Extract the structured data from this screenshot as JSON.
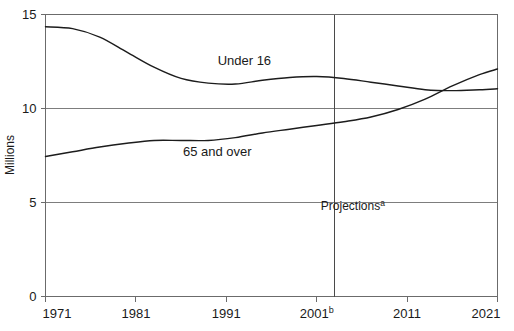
{
  "chart_data": {
    "type": "line",
    "title": "",
    "subtitle": "",
    "xlabel": "",
    "ylabel": "Millions",
    "xlim": [
      1971,
      2021
    ],
    "ylim": [
      0,
      15
    ],
    "grid": true,
    "grid_axis": "y",
    "legend_position": "inline-labels",
    "x_tick_labels": [
      "1971",
      "1981",
      "1991",
      "2001",
      "2011",
      "2021"
    ],
    "x_tick_values": [
      1971,
      1981,
      1991,
      2001,
      2011,
      2021
    ],
    "x_tick_superscripts": [
      "",
      "",
      "",
      "b",
      "",
      ""
    ],
    "y_tick_labels": [
      "0",
      "5",
      "10",
      "15"
    ],
    "y_tick_values": [
      0,
      5,
      10,
      15
    ],
    "annotations": [
      {
        "text": "Projections",
        "superscript": "a",
        "x": 2005,
        "y": 4.6
      }
    ],
    "vertical_divider": {
      "x": 2003,
      "label": "projections-boundary"
    },
    "series": [
      {
        "name": "Under 16",
        "label": "Under 16",
        "label_x": 1993,
        "label_y": 12.3,
        "x": [
          1971,
          1974,
          1977,
          1980,
          1983,
          1986,
          1989,
          1992,
          1995,
          1998,
          2001,
          2004,
          2007,
          2010,
          2013,
          2016,
          2019,
          2021
        ],
        "values": [
          14.35,
          14.25,
          13.8,
          13.0,
          12.2,
          11.6,
          11.35,
          11.3,
          11.5,
          11.65,
          11.7,
          11.6,
          11.4,
          11.2,
          11.0,
          10.95,
          11.0,
          11.05
        ]
      },
      {
        "name": "65 and over",
        "label": "65 and over",
        "label_x": 1990,
        "label_y": 7.5,
        "x": [
          1971,
          1974,
          1977,
          1980,
          1983,
          1986,
          1989,
          1992,
          1995,
          1998,
          2001,
          2004,
          2007,
          2010,
          2013,
          2016,
          2019,
          2021
        ],
        "values": [
          7.45,
          7.7,
          7.95,
          8.15,
          8.3,
          8.3,
          8.3,
          8.45,
          8.7,
          8.9,
          9.1,
          9.3,
          9.55,
          9.95,
          10.5,
          11.2,
          11.8,
          12.1
        ]
      }
    ]
  }
}
